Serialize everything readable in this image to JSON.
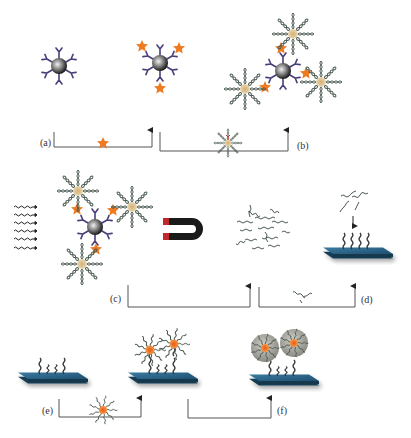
{
  "figure": {
    "type": "schematic",
    "panels": [
      {
        "id": "a",
        "label": "(a)",
        "reagent": "star-label-molecule",
        "description": "antibody-coated magnetic bead binds star labels"
      },
      {
        "id": "b",
        "label": "(b)",
        "reagent": "dna-coated-particle",
        "description": "labeled bead captures DNA-coated particles"
      },
      {
        "id": "c",
        "label": "(c)",
        "reagent": "magnet-and-heat",
        "description": "heating releases DNA strands, magnetic separation"
      },
      {
        "id": "d",
        "label": "(d)",
        "reagent": "free-dna-strand",
        "description": "released DNA hybridizes to surface probes"
      },
      {
        "id": "e",
        "label": "(e)",
        "reagent": "gold-nanoparticle-dna-probe",
        "description": "nanoparticle probes bind captured DNA"
      },
      {
        "id": "f",
        "label": "(f)",
        "reagent": "silver-enhancement",
        "description": "signal amplification on surface"
      }
    ],
    "colors": {
      "bead": "#3a3a3a",
      "antibody": "#4a3f7a",
      "star": "#f07a20",
      "dna": "#4a5a50",
      "particle_core": "#c8b48a",
      "magnet_body": "#1a1a1a",
      "magnet_tip": "#c0282a",
      "substrate": "#2a6080",
      "silver_shell": "#a8a8a0",
      "arrow_line": "#555555"
    }
  }
}
